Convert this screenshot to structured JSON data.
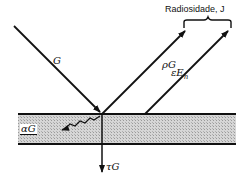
{
  "diagram": {
    "labels": {
      "incident": "G",
      "reflected": "ρG",
      "emitted_main": "εE",
      "emitted_sub": "n",
      "absorbed": "αG",
      "transmitted": "τG",
      "radiosity": "Radiosidade, J"
    },
    "colors": {
      "line": "#111111",
      "slab_fill": "#c9c9c9",
      "background": "#ffffff"
    }
  }
}
